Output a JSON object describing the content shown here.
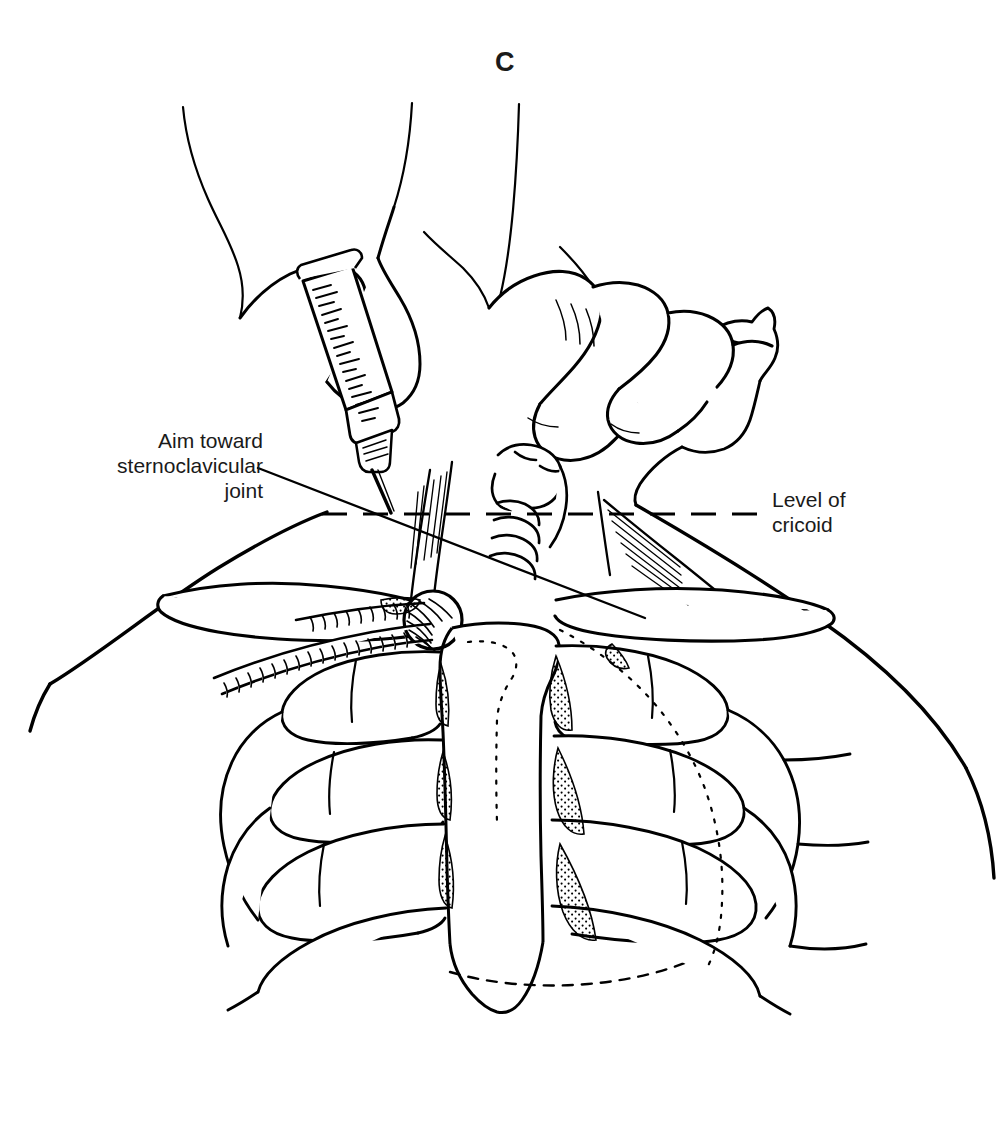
{
  "figure": {
    "panel_letter": "C",
    "kind": "medical-line-illustration",
    "background_color": "#ffffff",
    "ink_color": "#000000"
  },
  "labels": {
    "aim_label": {
      "text": "Aim toward\nsternoclavicular\njoint",
      "align": "right",
      "x": 88,
      "y": 428,
      "width": 175
    },
    "cricoid_label": {
      "text": "Level of\ncricoid",
      "align": "left",
      "x": 772,
      "y": 487,
      "width": 200
    }
  },
  "annotations": {
    "leader_line": {
      "from_x": 258,
      "from_y": 468,
      "to_x": 645,
      "to_y": 618,
      "name": "aim-leader-line"
    },
    "cricoid_level_line": {
      "y": 514,
      "x_start": 322,
      "x_end": 762,
      "style": "dashed",
      "name": "cricoid-level-dashed-line"
    }
  },
  "anatomy": {
    "structures": [
      "chin",
      "neck",
      "sternocleidomastoid-muscle",
      "trachea",
      "cricoid-cartilage",
      "clavicle-left",
      "clavicle-right",
      "sternoclavicular-joint",
      "manubrium",
      "sternum-body",
      "xiphoid-process",
      "ribs",
      "costal-cartilages",
      "shoulder-left",
      "shoulder-right"
    ]
  },
  "instruments": {
    "syringe": {
      "name": "syringe",
      "has_graduations": true,
      "graduation_count": 17,
      "needle_tip_x": 391,
      "needle_tip_y": 513
    },
    "hands": {
      "count": 2,
      "description": "operator hands: one holding syringe, one palpating landmark"
    }
  }
}
